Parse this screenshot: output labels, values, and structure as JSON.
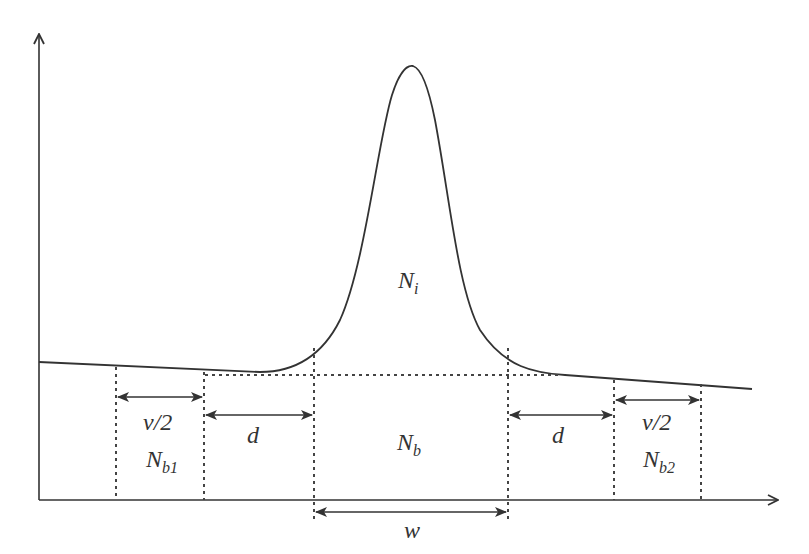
{
  "diagram": {
    "colors": {
      "line": "#333333",
      "dotted": "#444444",
      "text": "#333333",
      "background": "#ffffff"
    },
    "labels": {
      "peak_area": {
        "main": "N",
        "sub": "i"
      },
      "background_under_peak": {
        "main": "N",
        "sub": "b"
      },
      "left_background": {
        "main": "N",
        "sub": "b1"
      },
      "right_background": {
        "main": "N",
        "sub": "b2"
      },
      "left_window_width": "v/2",
      "right_window_width": "v/2",
      "left_gap": "d",
      "right_gap": "d",
      "peak_width": "w"
    },
    "axes": {
      "x_axis": "horizontal arrow",
      "y_axis": "vertical arrow"
    }
  }
}
